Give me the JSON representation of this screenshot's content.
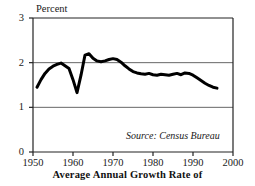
{
  "chart_data": {
    "type": "line",
    "title": "",
    "subtitle": "",
    "xlabel": "",
    "ylabel": "Percent",
    "xlim": [
      1950,
      2000
    ],
    "ylim": [
      0,
      3
    ],
    "grid": true,
    "gridlines_y": [
      1,
      2
    ],
    "legend": null,
    "legend_position": "none",
    "xticks": [
      1950,
      1960,
      1970,
      1980,
      1990,
      2000
    ],
    "xtick_labels": [
      "1950",
      "1960",
      "1970",
      "1980",
      "1990",
      "2000"
    ],
    "yticks": [
      0,
      1,
      2,
      3
    ],
    "ytick_labels": [
      "0",
      "1",
      "2",
      "3"
    ],
    "annotations": [
      {
        "name": "source-note",
        "text": "Source: Census Bureau",
        "style": "italic",
        "position": "bottom-right-inside-plot"
      }
    ],
    "caption": "Average Annual Growth Rate of",
    "line_color": "#000000",
    "line_width": 3,
    "series": [
      {
        "name": "Average Annual Growth Rate",
        "units": "percent",
        "x": [
          1951,
          1952,
          1953,
          1954,
          1955,
          1956,
          1957,
          1958,
          1959,
          1960,
          1961,
          1962,
          1963,
          1964,
          1965,
          1966,
          1967,
          1968,
          1969,
          1970,
          1971,
          1972,
          1973,
          1974,
          1975,
          1976,
          1977,
          1978,
          1979,
          1980,
          1981,
          1982,
          1983,
          1984,
          1985,
          1986,
          1987,
          1988,
          1989,
          1990,
          1991,
          1992,
          1993,
          1994,
          1995,
          1996
        ],
        "values": [
          1.45,
          1.62,
          1.76,
          1.86,
          1.92,
          1.96,
          1.99,
          1.93,
          1.87,
          1.62,
          1.33,
          1.72,
          2.17,
          2.2,
          2.1,
          2.04,
          2.02,
          2.04,
          2.07,
          2.09,
          2.07,
          2.01,
          1.93,
          1.86,
          1.8,
          1.77,
          1.75,
          1.74,
          1.76,
          1.73,
          1.72,
          1.74,
          1.73,
          1.72,
          1.74,
          1.76,
          1.73,
          1.77,
          1.76,
          1.72,
          1.66,
          1.6,
          1.54,
          1.49,
          1.45,
          1.43
        ]
      }
    ]
  },
  "plot": {
    "x_left": 33,
    "x_right": 233,
    "y_top": 18,
    "y_bottom": 152
  }
}
